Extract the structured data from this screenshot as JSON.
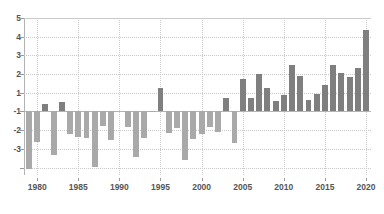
{
  "chart_data": {
    "type": "bar",
    "title": "",
    "subtitle": "",
    "xlabel": "",
    "ylabel": "",
    "ylim": [
      -3.4,
      5
    ],
    "grid": true,
    "legend": null,
    "baseline": 0,
    "y_tick_values": [
      5,
      4,
      3,
      2,
      1,
      0,
      -1,
      -2,
      -3
    ],
    "y_tick_labels": [
      "5",
      "4",
      "3",
      "2",
      "1",
      "-1",
      "-2",
      "-3",
      ""
    ],
    "y_axis_labels_rendered": [
      "5",
      "4",
      "3",
      "2",
      "1",
      "-1",
      "-2",
      "-3"
    ],
    "x_tick_labels": [
      "1980",
      "1985",
      "1990",
      "1995",
      "2000",
      "2005",
      "2010",
      "2015",
      "2020"
    ],
    "x_tick_values": [
      1980,
      1985,
      1990,
      1995,
      2000,
      2005,
      2010,
      2015,
      2020
    ],
    "xlim": [
      1978.4,
      2020.6
    ],
    "categories": [
      1979,
      1980,
      1981,
      1982,
      1983,
      1984,
      1985,
      1986,
      1987,
      1988,
      1989,
      1990,
      1991,
      1992,
      1993,
      1994,
      1995,
      1996,
      1997,
      1998,
      1999,
      2000,
      2001,
      2002,
      2003,
      2004,
      2005,
      2006,
      2007,
      2008,
      2009,
      2010,
      2011,
      2012,
      2013,
      2014,
      2015,
      2016,
      2017,
      2018,
      2019,
      2020
    ],
    "values": [
      -3.1,
      -1.65,
      0.38,
      -2.32,
      0.52,
      -1.2,
      -1.38,
      -1.42,
      -2.95,
      -0.78,
      -1.52,
      0.0,
      -0.85,
      -2.42,
      -1.43,
      -0.02,
      1.23,
      -1.17,
      -0.9,
      -2.6,
      -1.45,
      -1.22,
      -0.85,
      -1.1,
      0.73,
      -1.7,
      1.76,
      0.72,
      1.98,
      1.27,
      0.55,
      0.88,
      2.47,
      1.92,
      0.63,
      0.96,
      1.42,
      2.46,
      2.08,
      1.86,
      2.3,
      4.35
    ],
    "positive_color": "#7f7f7f",
    "negative_color": "#a9a9a9",
    "grid_color": "#c9c9c9",
    "axis_color": "#b3b3b3",
    "tick_label_color": "#555555",
    "background_color": "#ffffff"
  }
}
